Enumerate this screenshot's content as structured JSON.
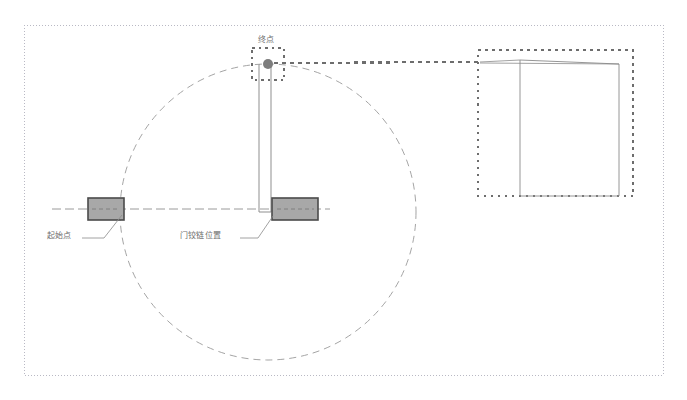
{
  "diagram": {
    "labels": {
      "end_point": "终点",
      "start_point": "起始点",
      "hinge_position": "门铰链位置"
    },
    "colors": {
      "frame_border": "#b9b9c4",
      "circle_stroke": "#9a9a9a",
      "panel_fill": "#a8a8a8",
      "panel_stroke": "#4a4a4a",
      "marker_fill": "#7d7d7d",
      "callout_stroke": "#707070",
      "detail_stroke": "#8a8a8a",
      "text": "#6e6e6e",
      "centerline": "#8f8f8f"
    },
    "geometry": {
      "frame": {
        "x": 24,
        "y": 25,
        "width": 639,
        "height": 350
      },
      "hinge_center": {
        "x": 268,
        "y": 212
      },
      "swing_radius": 148,
      "swing_sweep_degrees": 90,
      "start_panel": {
        "x": 88,
        "y": 198,
        "width": 36,
        "height": 22
      },
      "hinge_panel": {
        "x": 272,
        "y": 198,
        "width": 46,
        "height": 22
      },
      "door_leaf": {
        "x1": 259,
        "y1": 64,
        "x2": 271,
        "y2": 212
      },
      "end_marker": {
        "x": 268,
        "y": 64,
        "radius": 5
      },
      "end_marker_box": {
        "x": 252,
        "y": 48,
        "width": 32,
        "height": 32
      },
      "connector": {
        "x1": 274,
        "y1": 63,
        "x2": 478,
        "y2": 62
      },
      "detail_box": {
        "x": 478,
        "y": 50,
        "width": 155,
        "height": 146
      },
      "detail_panel": {
        "p1": {
          "x": 520,
          "y": 60
        },
        "p2": {
          "x": 619,
          "y": 64
        },
        "p3": {
          "x": 619,
          "y": 196
        },
        "p4": {
          "x": 520,
          "y": 196
        }
      },
      "detail_apex": {
        "x": 480,
        "y": 62
      },
      "centerline": {
        "x1": 52,
        "y1": 209,
        "x2": 330,
        "y2": 209
      },
      "leader_start": {
        "from": {
          "x": 82,
          "y": 238
        },
        "to": {
          "x": 122,
          "y": 214
        }
      },
      "leader_hinge": {
        "from": {
          "x": 240,
          "y": 238
        },
        "to": {
          "x": 272,
          "y": 214
        }
      }
    },
    "label_positions": {
      "end_point": {
        "x": 258,
        "y": 36
      },
      "start_point": {
        "x": 47,
        "y": 232
      },
      "hinge_position": {
        "x": 180,
        "y": 232
      }
    }
  }
}
